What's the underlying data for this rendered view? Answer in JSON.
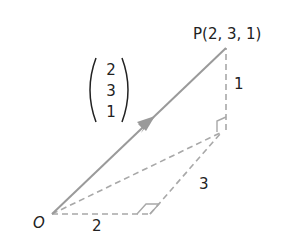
{
  "diagram": {
    "type": "3d-position-vector",
    "colors": {
      "vector_line": "#9a9a9a",
      "dashed_line": "#a8a8a8",
      "text": "#222222",
      "background": "#ffffff"
    },
    "points": {
      "origin": {
        "label": "O",
        "x": 52,
        "y": 214
      },
      "P": {
        "label": "P(2, 3, 1)",
        "x": 226,
        "y": 48
      },
      "foot_below_P": {
        "x": 226,
        "y": 130
      },
      "corner_x_leg": {
        "x": 150,
        "y": 214
      }
    },
    "column_vector": {
      "entries": [
        "2",
        "3",
        "1"
      ]
    },
    "edge_labels": {
      "x_leg": "2",
      "y_leg": "3",
      "z_leg": "1"
    },
    "right_angle_markers": [
      "at corner of x and y legs",
      "at foot below P"
    ]
  }
}
